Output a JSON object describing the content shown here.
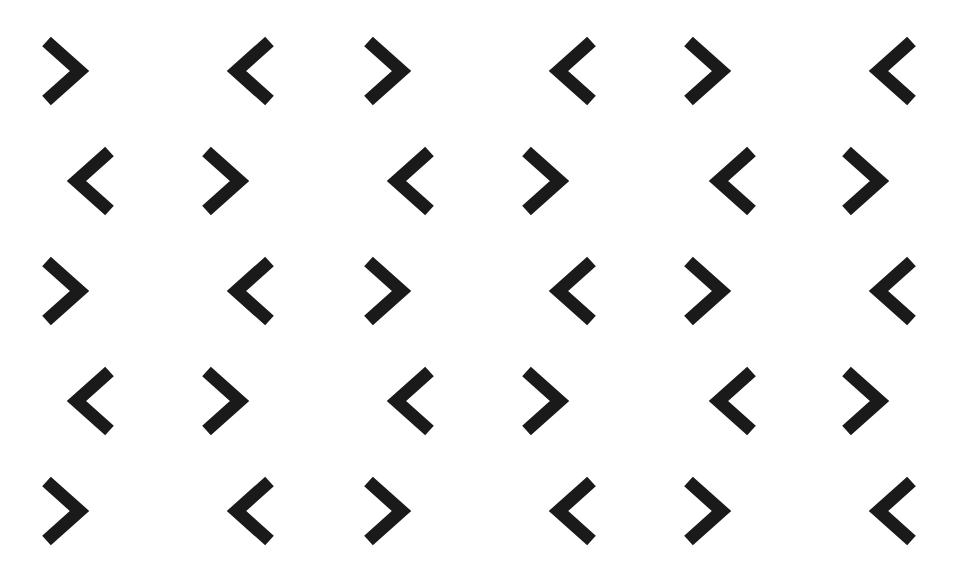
{
  "page": {
    "kind": "decorative-pattern",
    "width": 959,
    "height": 573,
    "background_color": "#ffffff"
  },
  "pattern": {
    "glyph_color": "#1a1a1a",
    "stroke_width": 13,
    "glyph_width": 46,
    "glyph_height": 72,
    "row_count": 5,
    "columns_per_row": 6,
    "row_y": [
      35,
      145,
      255,
      365,
      475
    ],
    "odd_row_x": [
      40,
      230,
      362,
      552,
      682,
      872
    ],
    "even_row_x": [
      70,
      200,
      390,
      520,
      712,
      840
    ],
    "odd_row_directions": [
      "right",
      "left",
      "right",
      "left",
      "right",
      "left"
    ],
    "even_row_directions": [
      "left",
      "right",
      "left",
      "right",
      "left",
      "right"
    ],
    "glyphs": [
      {
        "row": 1,
        "col": 1,
        "x": 40,
        "y": 35,
        "direction": "right",
        "symbol": ">"
      },
      {
        "row": 1,
        "col": 2,
        "x": 230,
        "y": 35,
        "direction": "left",
        "symbol": "<"
      },
      {
        "row": 1,
        "col": 3,
        "x": 362,
        "y": 35,
        "direction": "right",
        "symbol": ">"
      },
      {
        "row": 1,
        "col": 4,
        "x": 552,
        "y": 35,
        "direction": "left",
        "symbol": "<"
      },
      {
        "row": 1,
        "col": 5,
        "x": 682,
        "y": 35,
        "direction": "right",
        "symbol": ">"
      },
      {
        "row": 1,
        "col": 6,
        "x": 872,
        "y": 35,
        "direction": "left",
        "symbol": "<"
      },
      {
        "row": 2,
        "col": 1,
        "x": 70,
        "y": 145,
        "direction": "left",
        "symbol": "<"
      },
      {
        "row": 2,
        "col": 2,
        "x": 200,
        "y": 145,
        "direction": "right",
        "symbol": ">"
      },
      {
        "row": 2,
        "col": 3,
        "x": 390,
        "y": 145,
        "direction": "left",
        "symbol": "<"
      },
      {
        "row": 2,
        "col": 4,
        "x": 520,
        "y": 145,
        "direction": "right",
        "symbol": ">"
      },
      {
        "row": 2,
        "col": 5,
        "x": 712,
        "y": 145,
        "direction": "left",
        "symbol": "<"
      },
      {
        "row": 2,
        "col": 6,
        "x": 840,
        "y": 145,
        "direction": "right",
        "symbol": ">"
      },
      {
        "row": 3,
        "col": 1,
        "x": 40,
        "y": 255,
        "direction": "right",
        "symbol": ">"
      },
      {
        "row": 3,
        "col": 2,
        "x": 230,
        "y": 255,
        "direction": "left",
        "symbol": "<"
      },
      {
        "row": 3,
        "col": 3,
        "x": 362,
        "y": 255,
        "direction": "right",
        "symbol": ">"
      },
      {
        "row": 3,
        "col": 4,
        "x": 552,
        "y": 255,
        "direction": "left",
        "symbol": "<"
      },
      {
        "row": 3,
        "col": 5,
        "x": 682,
        "y": 255,
        "direction": "right",
        "symbol": ">"
      },
      {
        "row": 3,
        "col": 6,
        "x": 872,
        "y": 255,
        "direction": "left",
        "symbol": "<"
      },
      {
        "row": 4,
        "col": 1,
        "x": 70,
        "y": 365,
        "direction": "left",
        "symbol": "<"
      },
      {
        "row": 4,
        "col": 2,
        "x": 200,
        "y": 365,
        "direction": "right",
        "symbol": ">"
      },
      {
        "row": 4,
        "col": 3,
        "x": 390,
        "y": 365,
        "direction": "left",
        "symbol": "<"
      },
      {
        "row": 4,
        "col": 4,
        "x": 520,
        "y": 365,
        "direction": "right",
        "symbol": ">"
      },
      {
        "row": 4,
        "col": 5,
        "x": 712,
        "y": 365,
        "direction": "left",
        "symbol": "<"
      },
      {
        "row": 4,
        "col": 6,
        "x": 840,
        "y": 365,
        "direction": "right",
        "symbol": ">"
      },
      {
        "row": 5,
        "col": 1,
        "x": 40,
        "y": 475,
        "direction": "right",
        "symbol": ">"
      },
      {
        "row": 5,
        "col": 2,
        "x": 230,
        "y": 475,
        "direction": "left",
        "symbol": "<"
      },
      {
        "row": 5,
        "col": 3,
        "x": 362,
        "y": 475,
        "direction": "right",
        "symbol": ">"
      },
      {
        "row": 5,
        "col": 4,
        "x": 552,
        "y": 475,
        "direction": "left",
        "symbol": "<"
      },
      {
        "row": 5,
        "col": 5,
        "x": 682,
        "y": 475,
        "direction": "right",
        "symbol": ">"
      },
      {
        "row": 5,
        "col": 6,
        "x": 872,
        "y": 475,
        "direction": "left",
        "symbol": "<"
      }
    ]
  }
}
